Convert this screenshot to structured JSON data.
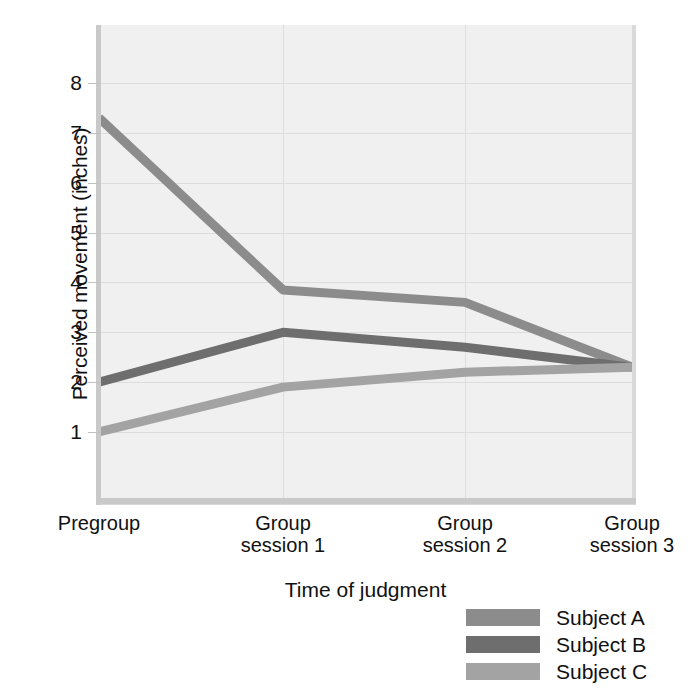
{
  "chart_data": {
    "type": "line",
    "title": "",
    "xlabel": "Time of judgment",
    "ylabel": "Perceived movement (inches)",
    "categories": [
      "Pregroup",
      "Group session 1",
      "Group session 2",
      "Group session 3"
    ],
    "category_lines": [
      [
        "Pregroup",
        ""
      ],
      [
        "Group",
        "session 1"
      ],
      [
        "Group",
        "session 2"
      ],
      [
        "Group",
        "session 3"
      ]
    ],
    "ylim": [
      0,
      8.6
    ],
    "yticks": [
      1,
      2,
      3,
      4,
      5,
      6,
      7,
      8
    ],
    "ytick_labels": [
      "1",
      "2",
      "3",
      "4",
      "5",
      "6",
      "7",
      "8"
    ],
    "grid": "both",
    "legend_position": "bottom-right",
    "series": [
      {
        "name": "Subject A",
        "color": "#8c8c8c",
        "values": [
          7.3,
          3.85,
          3.6,
          2.3
        ]
      },
      {
        "name": "Subject B",
        "color": "#6e6e6e",
        "values": [
          2.0,
          3.0,
          2.7,
          2.3
        ]
      },
      {
        "name": "Subject C",
        "color": "#a3a3a3",
        "values": [
          1.0,
          1.9,
          2.2,
          2.3
        ]
      }
    ]
  },
  "axes": {
    "y_title": "Perceived movement (inches)",
    "x_title": "Time of judgment"
  },
  "legend": {
    "items": [
      {
        "label": "Subject A",
        "color": "#8c8c8c"
      },
      {
        "label": "Subject B",
        "color": "#6e6e6e"
      },
      {
        "label": "Subject C",
        "color": "#a3a3a3"
      }
    ]
  },
  "colors": {
    "plot_background": "#f0f0f0",
    "gridline": "#dddddd",
    "axis": "#c9c9c9",
    "text": "#111111",
    "page_background": "#ffffff"
  }
}
